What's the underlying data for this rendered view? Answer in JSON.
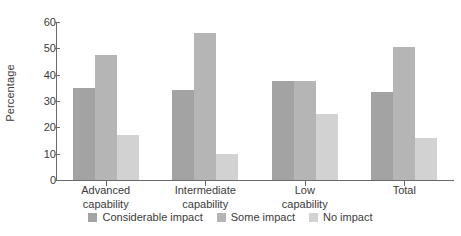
{
  "chart_data": {
    "type": "bar",
    "title": "",
    "xlabel": "",
    "ylabel": "Percentage",
    "ylim": [
      0,
      60
    ],
    "yticks": [
      0,
      10,
      20,
      30,
      40,
      50,
      60
    ],
    "grid": false,
    "legend_position": "bottom",
    "categories": [
      "Advanced capability",
      "Intermediate capability",
      "Low capability",
      "Total"
    ],
    "category_lines": [
      [
        "Advanced",
        "capability"
      ],
      [
        "Intermediate",
        "capability"
      ],
      [
        "Low",
        "capability"
      ],
      [
        "Total",
        ""
      ]
    ],
    "series": [
      {
        "name": "Considerable impact",
        "color": "#a3a3a3",
        "values": [
          35,
          34,
          37.5,
          33.5
        ]
      },
      {
        "name": "Some impact",
        "color": "#b5b5b5",
        "values": [
          47.5,
          56,
          37.5,
          50.5
        ]
      },
      {
        "name": "No impact",
        "color": "#d2d2d2",
        "values": [
          17,
          10,
          25,
          16
        ]
      }
    ]
  },
  "colors": {
    "axis": "#6a6a6a",
    "text": "#3b3b3b",
    "background": "#ffffff",
    "considerable_impact": "#a3a3a3",
    "some_impact": "#b5b5b5",
    "no_impact": "#d2d2d2"
  }
}
